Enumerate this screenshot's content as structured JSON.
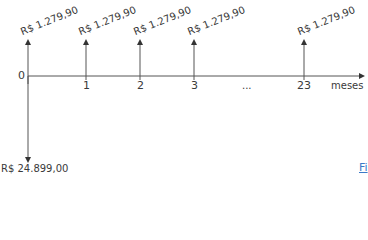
{
  "diagram": {
    "type": "cash-flow",
    "axis_label": "meses",
    "origin_label": "0",
    "ticks": [
      {
        "label": "1",
        "x": 86
      },
      {
        "label": "2",
        "x": 140
      },
      {
        "label": "3",
        "x": 194
      },
      {
        "label": "...",
        "x": 248
      },
      {
        "label": "23",
        "x": 304
      }
    ],
    "inflows": [
      {
        "period": "0",
        "value": "R$ 1.279,90"
      },
      {
        "period": "1",
        "value": "R$ 1.279,90"
      },
      {
        "period": "2",
        "value": "R$ 1.279,90"
      },
      {
        "period": "3",
        "value": "R$ 1.279,90"
      },
      {
        "period": "23",
        "value": "R$ 1.279,90"
      }
    ],
    "outflow": {
      "period": "0",
      "value": "R$ 24.899,00"
    },
    "corner_link": "Fi"
  },
  "colors": {
    "line": "#555555",
    "text": "#3a3a3a",
    "link": "#3b7ac7"
  }
}
